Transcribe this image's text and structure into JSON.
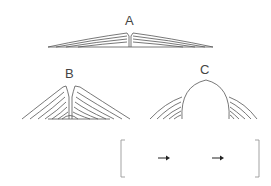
{
  "diagram": {
    "labels": {
      "a": "A",
      "b": "B",
      "c": "C"
    },
    "answer_box": {
      "arrows": [
        "→",
        "→"
      ],
      "slots": [
        "",
        "",
        ""
      ]
    },
    "colors": {
      "line": "#555555",
      "bracket": "#999999",
      "arrow": "#222222"
    }
  }
}
